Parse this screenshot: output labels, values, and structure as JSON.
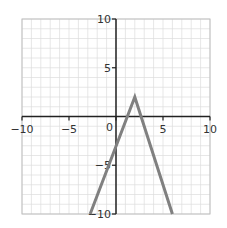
{
  "chart_data": {
    "type": "line",
    "title": "",
    "xlabel": "",
    "ylabel": "",
    "xlim": [
      -10,
      10
    ],
    "ylim": [
      -10,
      10
    ],
    "grid": true,
    "grid_minor_step": 1,
    "x_ticks": [
      -10,
      -5,
      0,
      5,
      10
    ],
    "y_ticks": [
      10,
      5,
      -5,
      -10
    ],
    "x_tick_labels": [
      "-10",
      "-5",
      "0",
      "5",
      "10"
    ],
    "y_tick_labels": [
      "10",
      "5",
      "-5",
      "-10"
    ],
    "origin_label": "0",
    "series": [
      {
        "name": "piecewise-linear",
        "color": "#808080",
        "points": [
          [
            -2.75,
            -10
          ],
          [
            2,
            2
          ],
          [
            6,
            -10
          ]
        ]
      }
    ]
  },
  "colors": {
    "grid": "#dcdcdc",
    "frame": "#bfbfbf",
    "axis": "#222222",
    "line": "#808080"
  }
}
